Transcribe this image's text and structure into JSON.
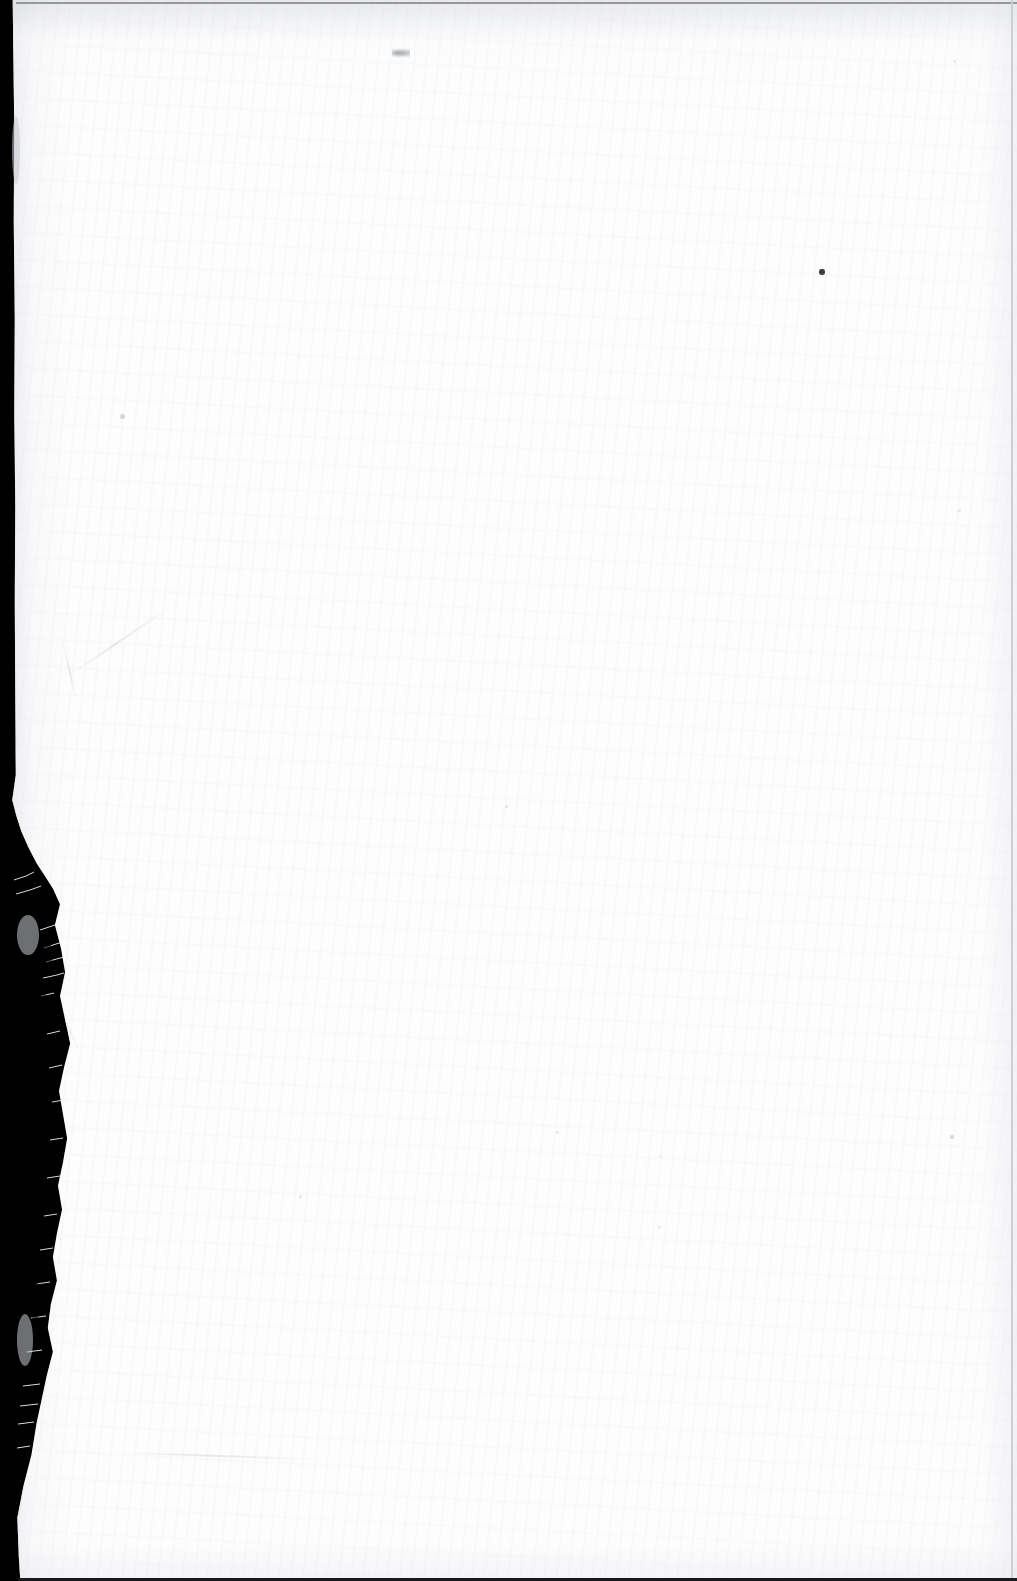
{
  "page": {
    "kind": "scanned-document-page",
    "content_state": "blank",
    "visible_text": "",
    "width_px": 1017,
    "height_px": 1581,
    "paper_color": "#fdfdfe",
    "scanner_background_color": "#000000"
  },
  "marks": {
    "top_mark": {
      "description": "faint-grey-smudge",
      "x": 392,
      "y": 48,
      "width": 18,
      "height": 10,
      "color": "#7a7c82"
    },
    "specks": [
      {
        "name": "speck-right-upper",
        "x": 819,
        "y": 269,
        "size": 6,
        "color": "#2b2b2e",
        "opacity": 0.92
      },
      {
        "name": "speck-left-mid",
        "x": 120,
        "y": 414,
        "size": 5,
        "color": "#c9cbd0",
        "opacity": 0.75
      },
      {
        "name": "speck-center",
        "x": 505,
        "y": 805,
        "size": 3,
        "color": "#d6d8dc",
        "opacity": 0.7
      },
      {
        "name": "speck-lower-left",
        "x": 299,
        "y": 1195,
        "size": 3,
        "color": "#d9dade",
        "opacity": 0.65
      },
      {
        "name": "speck-lower-mid",
        "x": 556,
        "y": 1131,
        "size": 3,
        "color": "#dcdde1",
        "opacity": 0.6
      },
      {
        "name": "speck-lower-right",
        "x": 658,
        "y": 1226,
        "size": 3,
        "color": "#dfe0e3",
        "opacity": 0.6
      },
      {
        "name": "speck-far-right",
        "x": 659,
        "y": 1155,
        "size": 3,
        "color": "#e0e1e4",
        "opacity": 0.55
      },
      {
        "name": "speck-mid-right",
        "x": 958,
        "y": 509,
        "size": 3,
        "color": "#dadbdf",
        "opacity": 0.6
      },
      {
        "name": "speck-upper-right",
        "x": 950,
        "y": 1135,
        "size": 4,
        "color": "#c8cace",
        "opacity": 0.7
      },
      {
        "name": "speck-top-right",
        "x": 953,
        "y": 60,
        "size": 3,
        "color": "#dcdde1",
        "opacity": 0.55
      },
      {
        "name": "speck-mid-page",
        "x": 1036,
        "y": 1380,
        "size": 3,
        "color": "#e1e2e5",
        "opacity": 0.5
      }
    ]
  },
  "edges": {
    "top_rule": {
      "name": "top-edge-rule",
      "color": "#96989d",
      "thickness_px": 2
    },
    "right_rule": {
      "name": "right-edge-rule",
      "color": "#cdcfd4",
      "thickness_px": 2
    },
    "bottom_rule": {
      "name": "bottom-edge-rule",
      "color": "#19191c",
      "thickness_px": 3
    },
    "left_tear": {
      "name": "torn-left-edge",
      "color": "#000000",
      "description": "frayed torn paper edge exposing black scanner background"
    }
  }
}
